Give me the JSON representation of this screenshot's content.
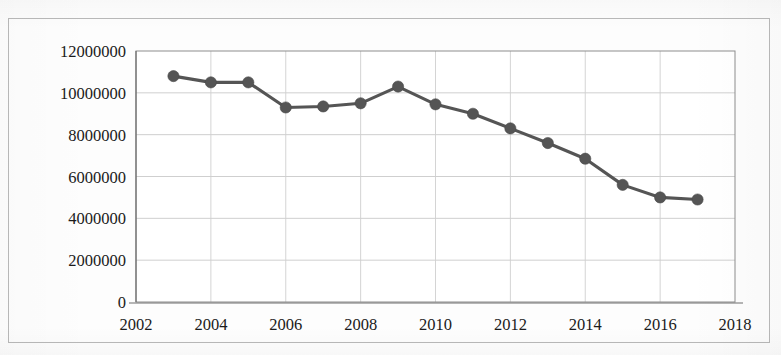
{
  "chart_data": {
    "type": "line",
    "title": "",
    "subtitle": "",
    "xlabel": "",
    "ylabel": "",
    "legend": [],
    "legend_position": "none",
    "grid": true,
    "grid_axes": "both",
    "xlim": [
      2002,
      2018
    ],
    "ylim": [
      0,
      12000000
    ],
    "x_tick_labels": [
      "2002",
      "2004",
      "2006",
      "2008",
      "2010",
      "2012",
      "2014",
      "2016",
      "2018"
    ],
    "x_ticks": [
      2002,
      2004,
      2006,
      2008,
      2010,
      2012,
      2014,
      2016,
      2018
    ],
    "y_tick_labels": [
      "0",
      "2000000",
      "4000000",
      "6000000",
      "8000000",
      "10000000",
      "12000000"
    ],
    "y_ticks": [
      0,
      2000000,
      4000000,
      6000000,
      8000000,
      10000000,
      12000000
    ],
    "series": [
      {
        "name": "series-1",
        "color": "#555555",
        "marker": "circle",
        "x": [
          2003,
          2004,
          2005,
          2006,
          2007,
          2008,
          2009,
          2010,
          2011,
          2012,
          2013,
          2014,
          2015,
          2016,
          2017
        ],
        "values": [
          10800000,
          10500000,
          10500000,
          9300000,
          9350000,
          9500000,
          10300000,
          9450000,
          9000000,
          8300000,
          7600000,
          6850000,
          5600000,
          5000000,
          4900000
        ]
      }
    ]
  },
  "figure": {
    "border_color": "#b9b9b9",
    "background": "#fdfdfd",
    "plot_background": "#ffffff",
    "gridline_color": "#c9c9c9",
    "axis_color": "#6e6e6e"
  }
}
